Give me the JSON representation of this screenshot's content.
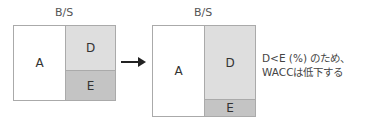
{
  "before": {
    "title": "B/S",
    "asset_label": "A",
    "debt_label": "D",
    "equity_label": "E"
  },
  "after": {
    "title": "B/S",
    "asset_label": "A",
    "debt_label": "D",
    "equity_label": "E"
  },
  "arrow": "arrow-right",
  "note": {
    "line1": "D<E (%) のため、",
    "line2": "WACCは低下する"
  },
  "colors": {
    "asset": "#ffffff",
    "debt": "#dedede",
    "equity": "#c4c4c4",
    "border": "#aaaaaa"
  }
}
